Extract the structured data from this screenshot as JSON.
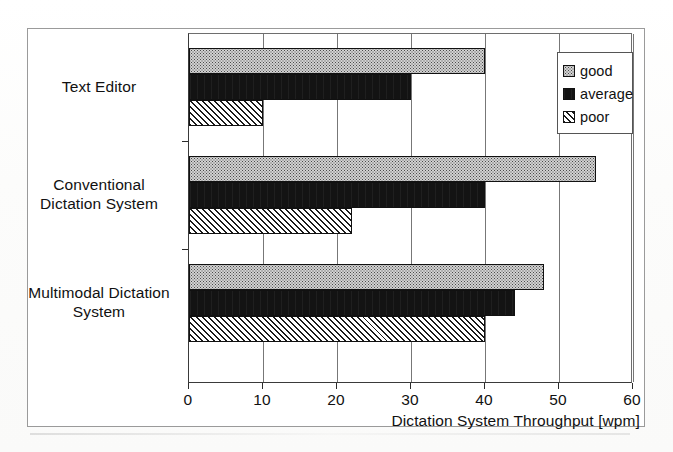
{
  "chart_data": {
    "type": "bar",
    "orientation": "horizontal",
    "title": "",
    "xlabel": "Dictation System Throughput [wpm]",
    "ylabel": "",
    "xlim": [
      0,
      60
    ],
    "xticks": [
      0,
      10,
      20,
      30,
      40,
      50,
      60
    ],
    "xticklabels": [
      "0",
      "10",
      "20",
      "30",
      "40",
      "50",
      "60"
    ],
    "grid": true,
    "grid_axis": "x",
    "legend_position": "upper right",
    "categories": [
      "Text Editor",
      "Conventional Dictation System",
      "Multimodal Dictation System"
    ],
    "category_label_lines": [
      [
        "Text Editor"
      ],
      [
        "Conventional",
        "Dictation System"
      ],
      [
        "Multimodal Dictation",
        "System"
      ]
    ],
    "series": [
      {
        "name": "good",
        "values": [
          40,
          55,
          48
        ],
        "fill": "stipple-light-grey",
        "swatch": "fill-good"
      },
      {
        "name": "average",
        "values": [
          30,
          40,
          44
        ],
        "fill": "solid-black",
        "swatch": "fill-average"
      },
      {
        "name": "poor",
        "values": [
          10,
          22,
          40
        ],
        "fill": "diagonal-hatch",
        "swatch": "fill-poor"
      }
    ],
    "units": "wpm"
  },
  "legend": {
    "items": [
      {
        "label": "good"
      },
      {
        "label": "average"
      },
      {
        "label": "poor"
      }
    ]
  },
  "axis": {
    "x_title": "Dictation System Throughput [wpm]"
  },
  "colors": {
    "frame": "#9a9a9a",
    "axis": "#3a3a3a",
    "gridline": "#777777",
    "bar_outline": "#111111",
    "good_fill": "#d2d2d2",
    "average_fill": "#131313",
    "poor_fill": "#ffffff",
    "text": "#111111",
    "background": "#ffffff"
  }
}
